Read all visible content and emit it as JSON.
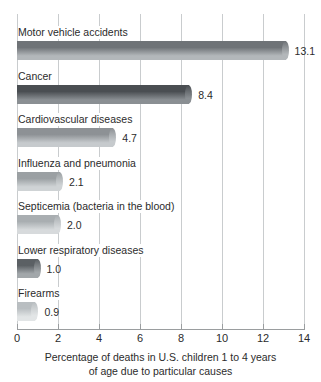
{
  "chart_data": {
    "type": "bar",
    "orientation": "horizontal",
    "title": "",
    "xlabel": "Percentage of deaths in U.S. children 1 to 4 years of age due to particular causes",
    "ylabel": "",
    "xlim": [
      0,
      14
    ],
    "xticks": [
      0,
      2,
      4,
      6,
      8,
      10,
      12,
      14
    ],
    "xtick_labels": [
      "0",
      "2",
      "4",
      "6",
      "8",
      "10",
      "12",
      "14"
    ],
    "grid": "vertical",
    "legend": "none",
    "categories": [
      "Motor vehicle accidents",
      "Cancer",
      "Cardiovascular diseases",
      "Influenza and pneumonia",
      "Septicemia (bacteria in the blood)",
      "Lower respiratory diseases",
      "Firearms"
    ],
    "values": [
      13.1,
      8.4,
      4.7,
      2.1,
      2.0,
      1.0,
      0.9
    ],
    "value_labels": [
      "13.1",
      "8.4",
      "4.7",
      "2.1",
      "2.0",
      "1.0",
      "0.9"
    ]
  },
  "caption": {
    "line1": "Percentage of deaths in U.S. children 1 to 4 years",
    "line2": "of age due to particular causes"
  },
  "colors": {
    "bar_top": [
      "#6f7377",
      "#4a4e52",
      "#8d9195",
      "#9ba0a3",
      "#a9aeb1",
      "#5b6064",
      "#b9bec1"
    ],
    "bar_bottom": [
      "#b3b7ba",
      "#8a8f93",
      "#c6cacd",
      "#cfd3d5",
      "#d7dadc",
      "#a2a7aa",
      "#e2e5e6"
    ],
    "gridline": "#c9ccce",
    "axis": "#9a9d9f",
    "text": "#2b2b2b",
    "background": "#ffffff"
  }
}
